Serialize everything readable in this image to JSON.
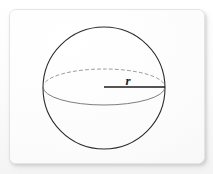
{
  "scene": {
    "background_color": "#fdfdfd",
    "card": {
      "name": "paper-card",
      "fill_color": "#fefefe",
      "border_color": "#e4e4e4",
      "x": 9,
      "y": 9,
      "width": 194,
      "height": 153,
      "corner_radius": 7
    }
  },
  "figure": {
    "labels": {
      "radius": "r"
    },
    "colors": {
      "outline": "#2b2b2b",
      "hidden_edge": "#8d8d8d",
      "visible_edge": "#6f6f6f",
      "radius_line": "#1d1d1d",
      "label": "#1d1d1d"
    },
    "geometry": {
      "sphere": {
        "center_x": 104,
        "center_y": 88,
        "radius": 61,
        "stroke_width": 1.1
      },
      "equator_ellipse": {
        "center_x": 104,
        "center_y": 87,
        "semi_major_x": 61,
        "semi_minor_y": 18,
        "back_half_style": "dashed",
        "front_half_style": "solid",
        "dash_pattern": "3 3"
      },
      "radius_segment": {
        "from_x": 104,
        "from_y": 87,
        "to_x": 165,
        "to_y": 87,
        "stroke_width": 1.3
      },
      "radius_label_position": {
        "x": 128,
        "y": 85
      }
    }
  }
}
